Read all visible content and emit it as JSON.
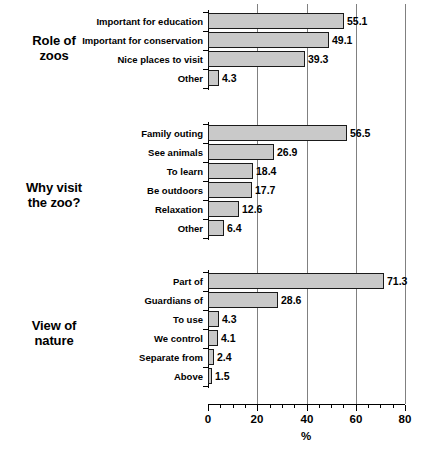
{
  "chart_data": {
    "type": "bar",
    "orientation": "horizontal",
    "title": "",
    "xlabel": "%",
    "ylabel": "",
    "xlim": [
      0,
      80
    ],
    "xticks": [
      0,
      20,
      40,
      60,
      80
    ],
    "xticklabels": [
      "0",
      "20",
      "40",
      "60",
      "80"
    ],
    "minor_tick_step": 5,
    "grid": "vertical gridlines at 20, 40, 60, 80",
    "legend": "none",
    "bar_fill": "#c9c9c9",
    "bar_edge": "#1a1a1a",
    "groups": [
      {
        "title_line1": "Role of",
        "title_line2": "zoos",
        "categories": [
          "Important for education",
          "Important for conservation",
          "Nice places to visit",
          "Other"
        ],
        "values": [
          55.1,
          49.1,
          39.3,
          4.3
        ],
        "value_labels": [
          "55.1",
          "49.1",
          "39.3",
          "4.3"
        ]
      },
      {
        "title_line1": "Why visit",
        "title_line2": "the zoo?",
        "categories": [
          "Family outing",
          "See animals",
          "To learn",
          "Be outdoors",
          "Relaxation",
          "Other"
        ],
        "values": [
          56.5,
          26.9,
          18.4,
          17.7,
          12.6,
          6.4
        ],
        "value_labels": [
          "56.5",
          "26.9",
          "18.4",
          "17.7",
          "12.6",
          "6.4"
        ]
      },
      {
        "title_line1": "View of",
        "title_line2": "nature",
        "categories": [
          "Part of",
          "Guardians of",
          "To use",
          "We control",
          "Separate from",
          "Above"
        ],
        "values": [
          71.3,
          28.6,
          4.3,
          4.1,
          2.4,
          1.5
        ],
        "value_labels": [
          "71.3",
          "28.6",
          "4.3",
          "4.1",
          "2.4",
          "1.5"
        ]
      }
    ]
  }
}
